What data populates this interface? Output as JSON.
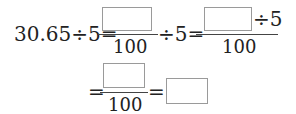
{
  "equation": {
    "row1": {
      "lhs": "30.65÷5=",
      "frac1_den": "100",
      "mid": "÷5=",
      "frac2_after_box": "÷5",
      "frac2_den": "100"
    },
    "row2": {
      "eq1": "=",
      "frac_den": "100",
      "eq2": "="
    }
  }
}
